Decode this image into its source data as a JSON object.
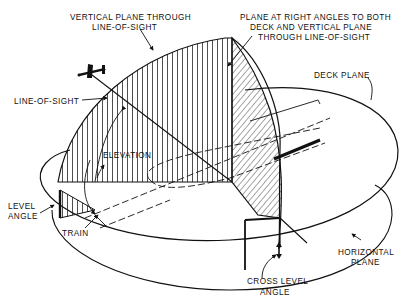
{
  "figure": {
    "colors": {
      "ink": "#111111",
      "background": "#ffffff"
    }
  },
  "labels": {
    "vertical_plane_line1": "VERTICAL PLANE THROUGH",
    "vertical_plane_line2": "LINE-OF-SIGHT",
    "right_angle_plane_line1": "PLANE AT RIGHT ANGLES TO BOTH",
    "right_angle_plane_line2": "DECK AND VERTICAL PLANE",
    "right_angle_plane_line3": "THROUGH LINE-OF-SIGHT",
    "deck_plane": "DECK PLANE",
    "line_of_sight": "LINE-OF-SIGHT",
    "elevation": "ELEVATION",
    "level_angle_line1": "LEVEL",
    "level_angle_line2": "ANGLE",
    "train": "TRAIN",
    "horizontal_plane_line1": "HORIZONTAL",
    "horizontal_plane_line2": "PLANE",
    "cross_level_line1": "CROSS LEVEL",
    "cross_level_line2": "ANGLE"
  },
  "icons": {
    "aircraft": "aircraft-silhouette-icon",
    "ship": "ship-deck-outline-icon"
  }
}
